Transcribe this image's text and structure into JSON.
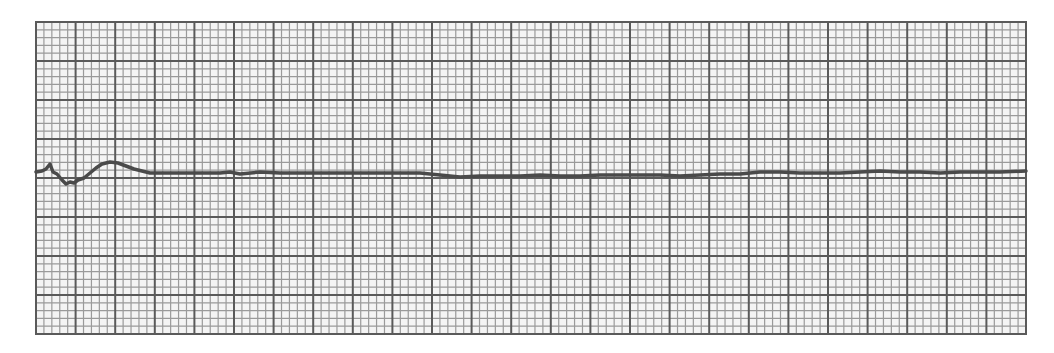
{
  "chart_data": {
    "type": "line",
    "title": "",
    "xlabel": "",
    "ylabel": "",
    "grid": {
      "on": true,
      "left": 36,
      "top": 22,
      "right": 1026,
      "bottom": 334,
      "major_columns": 25,
      "major_rows": 8,
      "minor_per_major": 5,
      "minor_color": "#9a9a9a",
      "major_color": "#5a5a5a",
      "paper_color": "#f4f4f4"
    },
    "trace": {
      "color": "#4a4a4a",
      "width": 3.5,
      "points": [
        [
          36,
          172
        ],
        [
          42,
          171
        ],
        [
          46,
          169
        ],
        [
          50,
          164
        ],
        [
          53,
          172
        ],
        [
          57,
          174
        ],
        [
          62,
          180
        ],
        [
          66,
          184
        ],
        [
          70,
          182
        ],
        [
          74,
          183
        ],
        [
          78,
          180
        ],
        [
          84,
          178
        ],
        [
          90,
          173
        ],
        [
          96,
          168
        ],
        [
          102,
          164
        ],
        [
          110,
          162
        ],
        [
          118,
          163
        ],
        [
          126,
          166
        ],
        [
          134,
          169
        ],
        [
          142,
          171
        ],
        [
          150,
          173
        ],
        [
          160,
          173
        ],
        [
          180,
          173
        ],
        [
          200,
          173
        ],
        [
          220,
          173
        ],
        [
          230,
          172
        ],
        [
          240,
          174
        ],
        [
          260,
          172
        ],
        [
          280,
          173
        ],
        [
          300,
          173
        ],
        [
          330,
          173
        ],
        [
          360,
          173
        ],
        [
          400,
          173
        ],
        [
          420,
          173
        ],
        [
          440,
          175
        ],
        [
          460,
          177
        ],
        [
          480,
          176
        ],
        [
          500,
          176
        ],
        [
          520,
          176
        ],
        [
          540,
          175
        ],
        [
          560,
          176
        ],
        [
          580,
          176
        ],
        [
          600,
          175
        ],
        [
          620,
          175
        ],
        [
          640,
          175
        ],
        [
          660,
          175
        ],
        [
          680,
          176
        ],
        [
          700,
          175
        ],
        [
          720,
          174
        ],
        [
          740,
          174
        ],
        [
          760,
          172
        ],
        [
          780,
          172
        ],
        [
          800,
          173
        ],
        [
          820,
          173
        ],
        [
          840,
          173
        ],
        [
          860,
          172
        ],
        [
          880,
          171
        ],
        [
          900,
          172
        ],
        [
          920,
          172
        ],
        [
          940,
          173
        ],
        [
          960,
          172
        ],
        [
          980,
          172
        ],
        [
          1000,
          172
        ],
        [
          1026,
          171
        ]
      ]
    }
  }
}
